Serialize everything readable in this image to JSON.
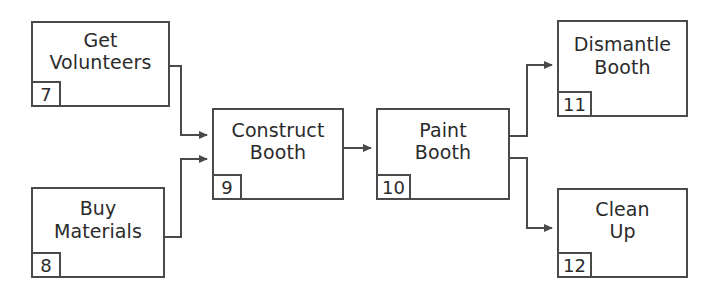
{
  "diagram": {
    "type": "activity-network-flowchart",
    "title": "",
    "background_color": "#ffffff",
    "line_color": "#4a4a4a",
    "text_color": "#2b2b2b",
    "nodes": [
      {
        "key": "get-volunteers",
        "lines": [
          "Get",
          "Volunteers"
        ],
        "id": "7",
        "x": 31,
        "y": 21,
        "w": 139,
        "h": 86
      },
      {
        "key": "buy-materials",
        "lines": [
          "Buy",
          "Materials"
        ],
        "id": "8",
        "x": 31,
        "y": 187,
        "w": 134,
        "h": 91
      },
      {
        "key": "construct-booth",
        "lines": [
          "Construct",
          "Booth"
        ],
        "id": "9",
        "x": 212,
        "y": 108,
        "w": 132,
        "h": 92
      },
      {
        "key": "paint-booth",
        "lines": [
          "Paint",
          "Booth"
        ],
        "id": "10",
        "x": 376,
        "y": 108,
        "w": 134,
        "h": 92
      },
      {
        "key": "dismantle-booth",
        "lines": [
          "Dismantle",
          "Booth"
        ],
        "id": "11",
        "x": 557,
        "y": 20,
        "w": 131,
        "h": 97
      },
      {
        "key": "clean-up",
        "lines": [
          "Clean",
          "Up"
        ],
        "id": "12",
        "x": 557,
        "y": 188,
        "w": 131,
        "h": 90
      }
    ],
    "edges": [
      {
        "key": "get-volunteers-to-construct-booth",
        "from": "get-volunteers",
        "to": "construct-booth",
        "path": "M 170 66 L 181 66 L 181 135 L 207 135"
      },
      {
        "key": "buy-materials-to-construct-booth",
        "from": "buy-materials",
        "to": "construct-booth",
        "path": "M 165 237 L 181 237 L 181 159 L 207 159"
      },
      {
        "key": "construct-booth-to-paint-booth",
        "from": "construct-booth",
        "to": "paint-booth",
        "path": "M 344 148 L 371 148"
      },
      {
        "key": "paint-booth-to-dismantle-booth",
        "from": "paint-booth",
        "to": "dismantle-booth",
        "path": "M 510 136 L 527 136 L 527 65 L 552 65"
      },
      {
        "key": "paint-booth-to-clean-up",
        "from": "paint-booth",
        "to": "clean-up",
        "path": "M 510 158 L 527 158 L 527 228 L 552 228"
      }
    ]
  }
}
